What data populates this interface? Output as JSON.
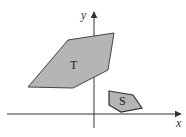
{
  "diagram": {
    "axes": {
      "x_label": "x",
      "y_label": "y",
      "origin": [
        94,
        114
      ],
      "x_range_px": [
        7,
        182
      ],
      "y_range_px": [
        11,
        128
      ],
      "color": "#333333"
    },
    "shapes": [
      {
        "name": "T",
        "label": "T",
        "points": "68,40 114,33 108,70 73,88 28,87",
        "fill": "#b5b5b5",
        "stroke": "#444444",
        "label_pos": [
          73,
          68
        ]
      },
      {
        "name": "S",
        "label": "S",
        "points": "109,91 133,95 142,108 121,112 109,105",
        "fill": "#b5b5b5",
        "stroke": "#333333",
        "label_pos": [
          123,
          104
        ]
      }
    ]
  }
}
